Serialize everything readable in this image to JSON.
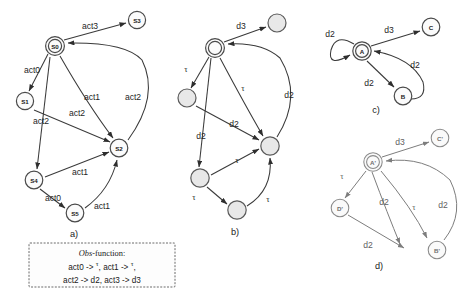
{
  "figure": {
    "type": "automata-diagram",
    "panels": [
      {
        "id": "a",
        "caption": "a)",
        "nodes": [
          {
            "id": "S0",
            "label": "S0",
            "shape": "double-circle",
            "x": 55,
            "y": 46
          },
          {
            "id": "S3",
            "label": "S3",
            "shape": "circle",
            "x": 137,
            "y": 20
          },
          {
            "id": "S1",
            "label": "S1",
            "shape": "circle",
            "x": 25,
            "y": 101
          },
          {
            "id": "S2",
            "label": "S2",
            "shape": "circle",
            "x": 119,
            "y": 148
          },
          {
            "id": "S4",
            "label": "S4",
            "shape": "circle",
            "x": 34,
            "y": 180
          },
          {
            "id": "S5",
            "label": "S5",
            "shape": "circle",
            "x": 75,
            "y": 213
          }
        ],
        "edges": [
          {
            "from": "S0",
            "to": "S3",
            "label": "act3"
          },
          {
            "from": "S0",
            "to": "S1",
            "label": "act0"
          },
          {
            "from": "S0",
            "to": "S2",
            "label": "act1"
          },
          {
            "from": "S0",
            "to": "S4",
            "label": "act2"
          },
          {
            "from": "S1",
            "to": "S2",
            "label": "act2"
          },
          {
            "from": "S2",
            "to": "S0",
            "label": "act2"
          },
          {
            "from": "S4",
            "to": "S2",
            "label": "act1"
          },
          {
            "from": "S4",
            "to": "S5",
            "label": "act0"
          },
          {
            "from": "S5",
            "to": "S2",
            "label": "act1"
          }
        ]
      },
      {
        "id": "b",
        "caption": "b)",
        "nodes": [
          {
            "id": "b0",
            "label": "",
            "shape": "double-circle",
            "x": 215,
            "y": 48
          },
          {
            "id": "b3",
            "label": "",
            "shape": "circle-gray",
            "x": 277,
            "y": 23
          },
          {
            "id": "b1",
            "label": "",
            "shape": "circle-gray",
            "x": 187,
            "y": 98
          },
          {
            "id": "b2",
            "label": "",
            "shape": "circle-gray",
            "x": 270,
            "y": 146
          },
          {
            "id": "b4",
            "label": "",
            "shape": "circle-gray",
            "x": 200,
            "y": 178
          },
          {
            "id": "b5",
            "label": "",
            "shape": "circle-gray",
            "x": 237,
            "y": 210
          }
        ],
        "edges": [
          {
            "from": "b0",
            "to": "b3",
            "label": "d3"
          },
          {
            "from": "b0",
            "to": "b1",
            "label": "τ"
          },
          {
            "from": "b0",
            "to": "b2",
            "label": "τ"
          },
          {
            "from": "b0",
            "to": "b4",
            "label": "d2"
          },
          {
            "from": "b1",
            "to": "b2",
            "label": "d2"
          },
          {
            "from": "b2",
            "to": "b0",
            "label": "d2"
          },
          {
            "from": "b4",
            "to": "b2",
            "label": "τ"
          },
          {
            "from": "b4",
            "to": "b5",
            "label": "τ"
          },
          {
            "from": "b5",
            "to": "b2",
            "label": "τ"
          }
        ]
      },
      {
        "id": "c",
        "caption": "c)",
        "nodes": [
          {
            "id": "A",
            "label": "A",
            "shape": "double-circle",
            "x": 362,
            "y": 51
          },
          {
            "id": "C",
            "label": "C",
            "shape": "circle",
            "x": 431,
            "y": 27
          },
          {
            "id": "B",
            "label": "B",
            "shape": "circle",
            "x": 403,
            "y": 96
          }
        ],
        "edges": [
          {
            "from": "A",
            "to": "A",
            "label": "d2"
          },
          {
            "from": "A",
            "to": "C",
            "label": "d3"
          },
          {
            "from": "A",
            "to": "B",
            "label": "d2"
          },
          {
            "from": "B",
            "to": "A",
            "label": "d2"
          }
        ]
      },
      {
        "id": "d",
        "caption": "d)",
        "nodes": [
          {
            "id": "Ap",
            "label": "A'",
            "shape": "double-circle",
            "x": 373,
            "y": 162
          },
          {
            "id": "Cp",
            "label": "C'",
            "shape": "circle",
            "x": 440,
            "y": 138
          },
          {
            "id": "Dp",
            "label": "D'",
            "shape": "circle",
            "x": 340,
            "y": 208
          },
          {
            "id": "Bp",
            "label": "B'",
            "shape": "circle",
            "x": 437,
            "y": 250
          }
        ],
        "edges": [
          {
            "from": "Ap",
            "to": "Cp",
            "label": "d3"
          },
          {
            "from": "Ap",
            "to": "Dp",
            "label": "τ"
          },
          {
            "from": "Ap",
            "to": "Bp",
            "label": "d2"
          },
          {
            "from": "Ap",
            "to": "Bp",
            "label": "τ"
          },
          {
            "from": "Bp",
            "to": "Ap",
            "label": "d2"
          },
          {
            "from": "Dp",
            "to": "Bp",
            "label": "d2"
          }
        ]
      }
    ],
    "legend": {
      "title_italic": "Obs",
      "title_rest": "-function:",
      "line1_a": "act0 -> ",
      "line1_tau1": "τ",
      "line1_b": ", act1 -> ",
      "line1_tau2": "τ",
      "line1_c": ",",
      "line2": "act2 -> d2, act3 -> d3"
    },
    "labels": {
      "act0": "act0",
      "act1": "act1",
      "act2": "act2",
      "act3": "act3",
      "d2": "d2",
      "d3": "d3",
      "tau": "τ"
    },
    "colors": {
      "stroke": "#3a3a3a",
      "stroke_light": "#7d7d7d",
      "node_fill": "#fbfbfb",
      "node_fill_gray": "#e8e8e8",
      "background": "#ffffff"
    }
  }
}
